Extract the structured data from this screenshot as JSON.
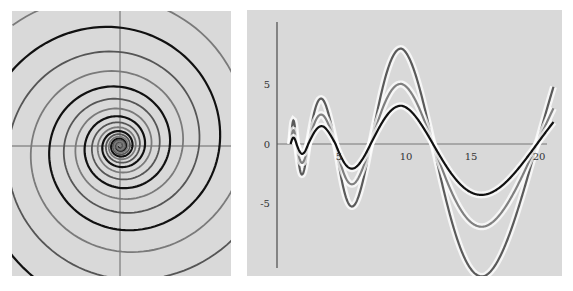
{
  "chart_data": [
    {
      "type": "line",
      "name": "logarithmic-spirals",
      "title": "",
      "xlabel": "",
      "ylabel": "",
      "grid": false,
      "axes": "crosshair through origin, no tick labels",
      "series": [
        {
          "name": "spiral-black",
          "color": "#111111",
          "phase_deg": 0,
          "growth_per_turn": 2.0
        },
        {
          "name": "spiral-dark-gray",
          "color": "#555555",
          "phase_deg": 120,
          "growth_per_turn": 2.0
        },
        {
          "name": "spiral-mid-gray",
          "color": "#7a7a7a",
          "phase_deg": 240,
          "growth_per_turn": 2.0
        }
      ]
    },
    {
      "type": "line",
      "name": "growing-oscillations",
      "title": "",
      "xlabel": "",
      "ylabel": "",
      "grid": false,
      "xlim": [
        0,
        21.3
      ],
      "ylim": [
        -11.5,
        11
      ],
      "x_ticks": [
        "5",
        "10",
        "15",
        "20"
      ],
      "y_ticks": [
        "5",
        "0",
        "-5"
      ],
      "x_tick_values": [
        5,
        10,
        15,
        20
      ],
      "y_tick_values": [
        5,
        0,
        -5
      ],
      "zero_crossings": [
        1.5,
        2.4,
        4.5,
        7.2,
        12.0,
        20.0
      ],
      "series": [
        {
          "name": "black",
          "color": "#111111",
          "extrema": [
            {
              "x": 1.2,
              "y": 0.5
            },
            {
              "x": 2.1,
              "y": -0.9
            },
            {
              "x": 3.6,
              "y": 1.6
            },
            {
              "x": 6.5,
              "y": -2.2
            },
            {
              "x": 9.6,
              "y": 3.25
            },
            {
              "x": 16.0,
              "y": -4.3
            }
          ]
        },
        {
          "name": "mid-gray",
          "color": "#808080",
          "extrema": [
            {
              "x": 1.2,
              "y": 1.1
            },
            {
              "x": 2.1,
              "y": -1.7
            },
            {
              "x": 3.6,
              "y": 2.6
            },
            {
              "x": 6.5,
              "y": -3.6
            },
            {
              "x": 9.6,
              "y": 5.1
            },
            {
              "x": 16.0,
              "y": -7.0
            }
          ]
        },
        {
          "name": "dark-gray",
          "color": "#5a5a5a",
          "extrema": [
            {
              "x": 1.2,
              "y": 1.9
            },
            {
              "x": 2.1,
              "y": -2.7
            },
            {
              "x": 3.6,
              "y": 4.0
            },
            {
              "x": 6.5,
              "y": -5.6
            },
            {
              "x": 9.6,
              "y": 8.1
            },
            {
              "x": 16.0,
              "y": -11.2
            }
          ]
        }
      ]
    }
  ]
}
